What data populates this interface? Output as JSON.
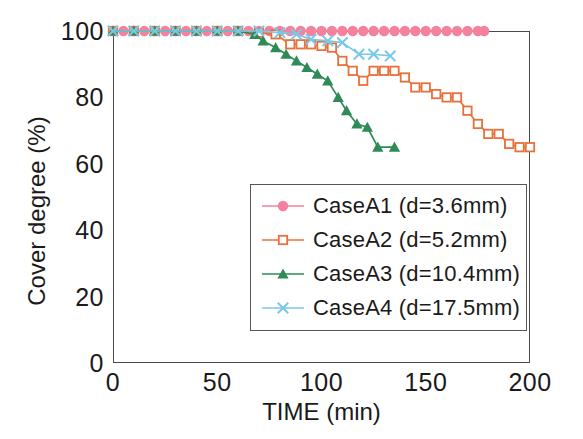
{
  "chart_data": {
    "type": "line",
    "title": "",
    "xlabel": "TIME (min)",
    "ylabel": "Cover degree (%)",
    "xlim": [
      0,
      200
    ],
    "ylim": [
      0,
      100
    ],
    "xticks": [
      0,
      50,
      100,
      150,
      200
    ],
    "yticks": [
      0,
      20,
      40,
      60,
      80,
      100
    ],
    "xtick_labels": [
      "0",
      "50",
      "100",
      "150",
      "200"
    ],
    "ytick_labels": [
      "0",
      "20",
      "40",
      "60",
      "80",
      "100"
    ],
    "grid": false,
    "legend_position": "center-right",
    "series": [
      {
        "name": "CaseA1 (d=3.6mm)",
        "label": "CaseA1",
        "detail": "(d=3.6mm)",
        "color": "#F4829E",
        "marker": "circle-filled",
        "x": [
          0,
          5,
          10,
          15,
          20,
          25,
          30,
          35,
          40,
          45,
          50,
          55,
          60,
          65,
          70,
          75,
          80,
          85,
          90,
          95,
          100,
          105,
          110,
          115,
          120,
          125,
          130,
          135,
          140,
          145,
          150,
          155,
          160,
          165,
          170,
          175,
          178
        ],
        "y": [
          100,
          100,
          100,
          100,
          100,
          100,
          100,
          100,
          100,
          100,
          100,
          100,
          100,
          100,
          100,
          100,
          100,
          100,
          100,
          100,
          100,
          100,
          100,
          100,
          100,
          100,
          100,
          100,
          100,
          100,
          100,
          100,
          100,
          100,
          100,
          100,
          100
        ]
      },
      {
        "name": "CaseA2 (d=5.2mm)",
        "label": "CaseA2",
        "detail": "(d=5.2mm)",
        "color": "#E8703A",
        "marker": "square-open",
        "x": [
          0,
          10,
          20,
          30,
          40,
          50,
          60,
          70,
          78,
          85,
          90,
          95,
          100,
          105,
          110,
          115,
          120,
          125,
          130,
          135,
          140,
          145,
          150,
          155,
          160,
          165,
          170,
          175,
          180,
          185,
          190,
          195,
          200
        ],
        "y": [
          100,
          100,
          100,
          100,
          100,
          100,
          100,
          99.5,
          99,
          96,
          96,
          96,
          95.5,
          95,
          91,
          88,
          85,
          88,
          88,
          88,
          86,
          83,
          83,
          81,
          80,
          80,
          76,
          72,
          69,
          69,
          66,
          65,
          65
        ]
      },
      {
        "name": "CaseA3 (d=10.4mm)",
        "label": "CaseA3",
        "detail": "(d=10.4mm)",
        "color": "#2E8B57",
        "marker": "triangle-filled",
        "x": [
          0,
          10,
          20,
          30,
          40,
          50,
          60,
          68,
          72,
          78,
          83,
          88,
          93,
          98,
          103,
          108,
          112,
          117,
          122,
          127,
          135
        ],
        "y": [
          100,
          100,
          100,
          100,
          100,
          100,
          100,
          99,
          97,
          95,
          93,
          91,
          89,
          87,
          85,
          80,
          76,
          72,
          71,
          65,
          65
        ]
      },
      {
        "name": "CaseA4 (d=17.5mm)",
        "label": "CaseA4",
        "detail": "(d=17.5mm)",
        "color": "#79C8E8",
        "marker": "cross",
        "x": [
          0,
          10,
          20,
          30,
          40,
          50,
          60,
          70,
          80,
          88,
          95,
          103,
          110,
          118,
          125,
          133
        ],
        "y": [
          100,
          100,
          100,
          100,
          100,
          100,
          100,
          100,
          99.5,
          99,
          97.5,
          97,
          96.5,
          93,
          93,
          92.5
        ]
      }
    ]
  },
  "legend": {
    "entries": [
      {
        "label": "CaseA1  (d=3.6mm)"
      },
      {
        "label": "CaseA2  (d=5.2mm)"
      },
      {
        "label": "CaseA3  (d=10.4mm)"
      },
      {
        "label": "CaseA4  (d=17.5mm)"
      }
    ]
  },
  "axes": {
    "x_title": "TIME (min)",
    "y_title": "Cover degree (%)"
  }
}
